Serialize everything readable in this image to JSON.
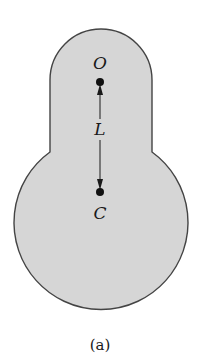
{
  "diagram": {
    "type": "physical-pendulum",
    "caption": "(a)",
    "body_fill": "#d6d6d6",
    "outline_color": "#444444",
    "points": [
      {
        "id": "O",
        "label": "O",
        "description": "pivot point"
      },
      {
        "id": "C",
        "label": "C",
        "description": "center of oscillation"
      }
    ],
    "dimension": {
      "label": "L",
      "from": "O",
      "to": "C"
    }
  }
}
